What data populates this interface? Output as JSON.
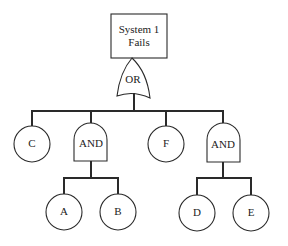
{
  "diagram": {
    "type": "fault-tree",
    "top_event": {
      "line1": "System 1",
      "line2": "Fails"
    },
    "gates": {
      "or_gate": {
        "label": "OR"
      },
      "and_gate_left": {
        "label": "AND"
      },
      "and_gate_right": {
        "label": "AND"
      }
    },
    "basic_events": {
      "c": {
        "label": "C"
      },
      "f": {
        "label": "F"
      },
      "a": {
        "label": "A"
      },
      "b": {
        "label": "B"
      },
      "d": {
        "label": "D"
      },
      "e": {
        "label": "E"
      }
    },
    "structure": [
      {
        "from": "System 1 Fails",
        "to": "OR"
      },
      {
        "from": "OR",
        "to": [
          "C",
          "AND (left)",
          "F",
          "AND (right)"
        ]
      },
      {
        "from": "AND (left)",
        "to": [
          "A",
          "B"
        ]
      },
      {
        "from": "AND (right)",
        "to": [
          "D",
          "E"
        ]
      }
    ],
    "colors": {
      "stroke": "#2a2a2a",
      "background": "#ffffff",
      "text": "#222222"
    }
  }
}
